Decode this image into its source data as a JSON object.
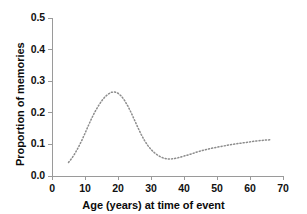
{
  "chart_data": {
    "type": "line",
    "title": "",
    "xlabel": "Age (years) at time of event",
    "ylabel": "Proportion of memories",
    "xlim": [
      0,
      70
    ],
    "ylim": [
      0.0,
      0.5
    ],
    "xticks": [
      0,
      10,
      20,
      30,
      40,
      50,
      60,
      70
    ],
    "xtick_labels": [
      "0",
      "10",
      "20",
      "30",
      "40",
      "50",
      "60",
      "70"
    ],
    "yticks": [
      0.0,
      0.1,
      0.2,
      0.3,
      0.4,
      0.5
    ],
    "ytick_labels": [
      "0.0",
      "0.1",
      "0.2",
      "0.3",
      "0.4",
      "0.5"
    ],
    "grid": false,
    "legend": null,
    "line_style": "dotted",
    "line_color": "#8c8c8c",
    "series": [
      {
        "name": "Proportion of memories",
        "x": [
          5,
          6,
          7,
          8,
          9,
          10,
          11,
          12,
          13,
          14,
          15,
          16,
          17,
          18,
          19,
          20,
          21,
          22,
          23,
          24,
          25,
          26,
          27,
          28,
          29,
          30,
          31,
          32,
          33,
          34,
          35,
          36,
          37,
          38,
          39,
          40,
          42,
          44,
          46,
          48,
          50,
          52,
          54,
          56,
          58,
          60,
          62,
          64,
          66.5
        ],
        "values": [
          0.043,
          0.056,
          0.072,
          0.091,
          0.112,
          0.135,
          0.159,
          0.182,
          0.203,
          0.221,
          0.237,
          0.25,
          0.259,
          0.265,
          0.266,
          0.262,
          0.253,
          0.239,
          0.221,
          0.2,
          0.177,
          0.154,
          0.132,
          0.113,
          0.097,
          0.084,
          0.074,
          0.066,
          0.06,
          0.056,
          0.054,
          0.054,
          0.055,
          0.057,
          0.06,
          0.063,
          0.069,
          0.076,
          0.082,
          0.087,
          0.091,
          0.095,
          0.099,
          0.102,
          0.105,
          0.108,
          0.111,
          0.113,
          0.115
        ]
      }
    ]
  },
  "axes": {
    "axis_color": "#9a9a9a",
    "origin_px": {
      "x": 52,
      "y": 176
    },
    "x_end_px": 283,
    "y_top_px": 18
  }
}
